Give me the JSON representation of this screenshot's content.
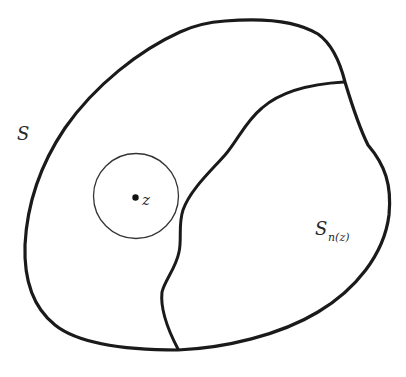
{
  "figure": {
    "labels": {
      "region_S": "S",
      "point_z": "z",
      "subregion_main": "S",
      "subregion_sub": "n(z)"
    },
    "colors": {
      "stroke": "#1a1a1a",
      "background": "#ffffff"
    },
    "elements": [
      {
        "type": "closed-curve",
        "name": "region S boundary"
      },
      {
        "type": "curve",
        "name": "dividing curve bounding S_n(z)"
      },
      {
        "type": "circle",
        "name": "disk around z"
      },
      {
        "type": "point",
        "name": "z"
      }
    ]
  }
}
